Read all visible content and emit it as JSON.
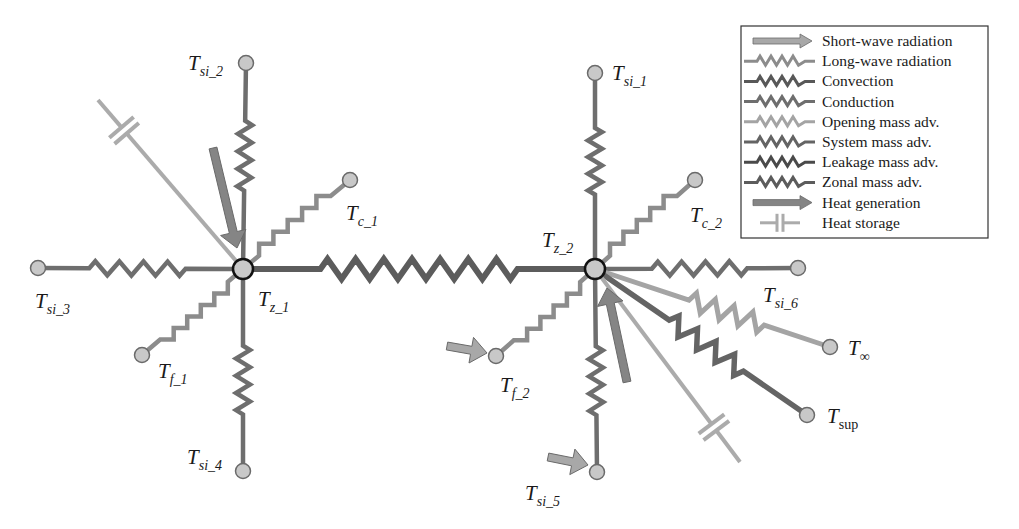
{
  "diagram": {
    "colors": {
      "short_wave": "#a8a8a8",
      "long_wave": "#8c8c8c",
      "convection": "#585858",
      "conduction": "#6e6e6e",
      "opening": "#a4a4a4",
      "system": "#646464",
      "leakage": "#4a4a4a",
      "zonal": "#5c5c5c",
      "heat_gen": "#858585",
      "storage": "#ababab",
      "node_fill": "#c8c8c8",
      "node_stroke": "#6a6a6a",
      "zone_node_stroke": "#111111"
    },
    "nodes": [
      {
        "id": "tz1",
        "base": "T",
        "sub": "z_1",
        "kind": "zone"
      },
      {
        "id": "tz2",
        "base": "T",
        "sub": "z_2",
        "kind": "zone"
      },
      {
        "id": "tsi1",
        "base": "T",
        "sub": "si_1",
        "kind": "surface"
      },
      {
        "id": "tsi2",
        "base": "T",
        "sub": "si_2",
        "kind": "surface"
      },
      {
        "id": "tsi3",
        "base": "T",
        "sub": "si_3",
        "kind": "surface"
      },
      {
        "id": "tsi4",
        "base": "T",
        "sub": "si_4",
        "kind": "surface"
      },
      {
        "id": "tsi5",
        "base": "T",
        "sub": "si_5",
        "kind": "surface"
      },
      {
        "id": "tsi6",
        "base": "T",
        "sub": "si_6",
        "kind": "surface"
      },
      {
        "id": "tc1",
        "base": "T",
        "sub": "c_1",
        "kind": "ceiling"
      },
      {
        "id": "tc2",
        "base": "T",
        "sub": "c_2",
        "kind": "ceiling"
      },
      {
        "id": "tf1",
        "base": "T",
        "sub": "f_1",
        "kind": "floor"
      },
      {
        "id": "tf2",
        "base": "T",
        "sub": "f_2",
        "kind": "floor"
      },
      {
        "id": "tinf",
        "base": "T",
        "sub": "∞",
        "kind": "outdoor"
      },
      {
        "id": "tsup",
        "base": "T",
        "sub": "sup",
        "kind": "supply"
      }
    ],
    "links": [
      {
        "from": "tz1",
        "to": "tsi2",
        "type": "conduction"
      },
      {
        "from": "tz1",
        "to": "tsi3",
        "type": "conduction"
      },
      {
        "from": "tz1",
        "to": "tsi4",
        "type": "conduction"
      },
      {
        "from": "tz1",
        "to": "tc1",
        "type": "long_wave"
      },
      {
        "from": "tz1",
        "to": "tf1",
        "type": "long_wave"
      },
      {
        "from": "tz1",
        "to": "tz2",
        "type": "zonal"
      },
      {
        "from": "tz2",
        "to": "tsi1",
        "type": "conduction"
      },
      {
        "from": "tz2",
        "to": "tsi5",
        "type": "conduction"
      },
      {
        "from": "tz2",
        "to": "tsi6",
        "type": "conduction"
      },
      {
        "from": "tz2",
        "to": "tc2",
        "type": "long_wave"
      },
      {
        "from": "tz2",
        "to": "tf2",
        "type": "long_wave"
      },
      {
        "from": "tz2",
        "to": "tinf",
        "type": "opening"
      },
      {
        "from": "tz2",
        "to": "tsup",
        "type": "system"
      }
    ],
    "elements": [
      {
        "at": "tz1",
        "type": "heat_storage"
      },
      {
        "at": "tz1",
        "type": "heat_generation"
      },
      {
        "at": "tz2",
        "type": "heat_storage"
      },
      {
        "at": "tz2",
        "type": "heat_generation"
      },
      {
        "at": "tf2",
        "type": "short_wave"
      },
      {
        "at": "tsi5",
        "type": "short_wave"
      }
    ]
  },
  "legend": {
    "items": [
      {
        "label": "Short-wave radiation",
        "symbol": "arrow",
        "color_key": "short_wave"
      },
      {
        "label": "Long-wave radiation",
        "symbol": "zigzag",
        "color_key": "long_wave"
      },
      {
        "label": "Convection",
        "symbol": "zigzag",
        "color_key": "convection"
      },
      {
        "label": "Conduction",
        "symbol": "zigzag",
        "color_key": "conduction"
      },
      {
        "label": "Opening mass adv.",
        "symbol": "zigzag",
        "color_key": "opening"
      },
      {
        "label": "System mass adv.",
        "symbol": "zigzag",
        "color_key": "system"
      },
      {
        "label": "Leakage mass adv.",
        "symbol": "zigzag",
        "color_key": "leakage"
      },
      {
        "label": "Zonal mass adv.",
        "symbol": "zigzag",
        "color_key": "zonal"
      },
      {
        "label": "Heat generation",
        "symbol": "arrow",
        "color_key": "heat_gen"
      },
      {
        "label": "Heat storage",
        "symbol": "capacitor",
        "color_key": "storage"
      }
    ]
  }
}
